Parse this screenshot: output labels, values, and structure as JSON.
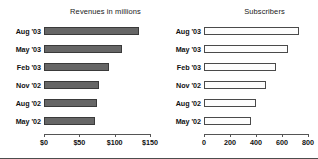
{
  "figure": {
    "width": 318,
    "height": 159,
    "background": "#ffffff",
    "frame_color": "#4d4d4d"
  },
  "chart_data": [
    {
      "type": "bar",
      "orientation": "horizontal",
      "panel": "left",
      "title": "Revenues in millions",
      "xlabel": "",
      "ylabel": "",
      "categories": [
        "Aug '03",
        "May '03",
        "Feb '03",
        "Nov '02",
        "Aug '02",
        "May '02"
      ],
      "values": [
        134,
        110,
        92,
        78,
        75,
        72
      ],
      "xlim": [
        0,
        150
      ],
      "ticks": [
        0,
        50,
        100,
        150
      ],
      "tick_labels": [
        "$0",
        "$50",
        "$100",
        "$150"
      ],
      "bar_style": "filled",
      "bar_fill": "#666666",
      "bar_edge": "#3a3a3a",
      "grid": false,
      "legend": false
    },
    {
      "type": "bar",
      "orientation": "horizontal",
      "panel": "right",
      "title": "Subscribers",
      "xlabel": "",
      "ylabel": "",
      "categories": [
        "Aug '03",
        "May '03",
        "Feb '03",
        "Nov '02",
        "Aug '02",
        "May '02"
      ],
      "values": [
        730,
        645,
        555,
        480,
        400,
        360
      ],
      "xlim": [
        0,
        800
      ],
      "ticks": [
        0,
        200,
        400,
        600,
        800
      ],
      "tick_labels": [
        "0",
        "200",
        "400",
        "600",
        "800"
      ],
      "bar_style": "hollow",
      "bar_fill": "#fdfdfd",
      "bar_edge": "#4a4a4a",
      "grid": false,
      "legend": false
    }
  ]
}
